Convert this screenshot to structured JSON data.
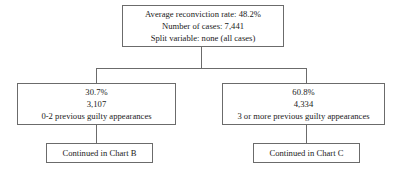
{
  "chart_data": {
    "type": "diagram",
    "title": "",
    "diagram_kind": "classification-tree",
    "root": {
      "average_reconviction_rate": "48.2%",
      "number_of_cases": "7,441",
      "split_variable": "none (all cases)"
    },
    "branches": [
      {
        "rate": "30.7%",
        "cases": "3,107",
        "group": "0-2 previous guilty appearances",
        "continuation": "Continued in Chart B"
      },
      {
        "rate": "60.8%",
        "cases": "4,334",
        "group": "3 or more previous guilty appearances",
        "continuation": "Continued in Chart C"
      }
    ],
    "colors": {
      "background": "#ffffff",
      "border": "#6b6b6b",
      "text": "#1a1a1a"
    }
  },
  "nodes": {
    "root": {
      "line1": "Average reconviction rate: 48.2%",
      "line2": "Number of cases: 7,441",
      "line3": "Split variable: none (all cases)"
    },
    "left": {
      "line1": "30.7%",
      "line2": "3,107",
      "line3": "0-2 previous guilty appearances"
    },
    "right": {
      "line1": "60.8%",
      "line2": "4,334",
      "line3": "3 or more previous guilty appearances"
    },
    "continued_left": {
      "label": "Continued in Chart B"
    },
    "continued_right": {
      "label": "Continued in Chart C"
    }
  }
}
